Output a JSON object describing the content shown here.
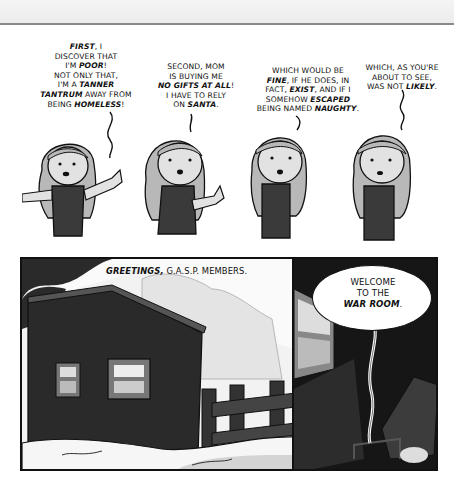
{
  "comic": {
    "top_row": [
      {
        "lines": [
          "<b>FIRST</b>, I",
          "DISCOVER THAT",
          "I'M <b>POOR</b>!",
          "NOT ONLY THAT,",
          "I'M A <b>TANNER</b>",
          "<b>TANTRUM</b> AWAY FROM",
          "BEING <b>HOMELESS</b>!"
        ],
        "text": "FIRST, I DISCOVER THAT I'M POOR! NOT ONLY THAT, I'M A TANNER TANTRUM AWAY FROM BEING HOMELESS!"
      },
      {
        "lines": [
          "SECOND, MOM",
          "IS BUYING ME",
          "<b>NO GIFTS AT ALL</b>!",
          "I HAVE TO RELY",
          "ON <b>SANTA</b>."
        ],
        "text": "SECOND, MOM IS BUYING ME NO GIFTS AT ALL! I HAVE TO RELY ON SANTA."
      },
      {
        "lines": [
          "WHICH WOULD BE",
          "<b>FINE</b>, IF HE DOES, IN",
          "FACT, <b>EXIST</b>, AND IF I",
          "SOMEHOW <b>ESCAPED</b>",
          "BEING NAMED <b>NAUGHTY</b>."
        ],
        "text": "WHICH WOULD BE FINE, IF HE DOES, IN FACT, EXIST, AND IF I SOMEHOW ESCAPED BEING NAMED NAUGHTY."
      },
      {
        "lines": [
          "WHICH, AS YOU'RE",
          "ABOUT TO SEE,",
          "WAS NOT <b>LIKELY</b>."
        ],
        "text": "WHICH, AS YOU'RE ABOUT TO SEE, WAS NOT LIKELY."
      }
    ],
    "bottom_left": {
      "caption_bold": "GREETINGS,",
      "caption_rest": " G.A.S.P. MEMBERS."
    },
    "bottom_right": {
      "balloon_lines": [
        "WELCOME",
        "TO THE",
        "<b>WAR ROOM</b>."
      ],
      "balloon_text": "WELCOME TO THE WAR ROOM."
    }
  },
  "colors": {
    "ink": "#111111",
    "hair": "#b8b8b8",
    "skin": "#e2e2e2",
    "shirt": "#3a3a3a",
    "shed": "#2a2a2a",
    "sky": "#f2f2f2",
    "snow": "#f6f6f6"
  }
}
